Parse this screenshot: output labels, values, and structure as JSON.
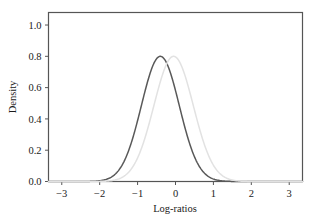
{
  "chart_data": {
    "type": "line",
    "title": "",
    "subtitle": "",
    "xlabel": "Log-ratios",
    "ylabel": "Density",
    "xlim": [
      -3.35,
      3.35
    ],
    "ylim": [
      0.0,
      1.08
    ],
    "grid": false,
    "legend": "none",
    "xticks": [
      "-3",
      "-2",
      "-1",
      "0",
      "1",
      "2",
      "3"
    ],
    "xtick_values": [
      -3,
      -2,
      -1,
      0,
      1,
      2,
      3
    ],
    "yticks": [
      "0.0",
      "0.2",
      "0.4",
      "0.6",
      "0.8",
      "1.0"
    ],
    "ytick_values": [
      0.0,
      0.2,
      0.4,
      0.6,
      0.8,
      1.0
    ],
    "series": [
      {
        "name": "dark-density-curve",
        "color": "#595959",
        "peak_x": -0.4,
        "peak_y": 0.8,
        "mean": -0.4,
        "sd": 0.5,
        "x": [
          -2.4,
          -2.2,
          -2.0,
          -1.9,
          -1.8,
          -1.7,
          -1.6,
          -1.5,
          -1.4,
          -1.3,
          -1.2,
          -1.1,
          -1.0,
          -0.9,
          -0.8,
          -0.7,
          -0.6,
          -0.5,
          -0.4,
          -0.3,
          -0.2,
          -0.1,
          0.0,
          0.1,
          0.2,
          0.3,
          0.4,
          0.5,
          0.6,
          0.7,
          0.8,
          0.9,
          1.0,
          1.1,
          1.2,
          1.3,
          1.4,
          1.6,
          1.8
        ],
        "y": [
          0.0,
          0.001,
          0.003,
          0.005,
          0.009,
          0.015,
          0.025,
          0.039,
          0.06,
          0.088,
          0.124,
          0.169,
          0.222,
          0.282,
          0.346,
          0.411,
          0.475,
          0.533,
          0.58,
          0.614,
          0.631,
          0.631,
          0.614,
          0.58,
          0.533,
          0.475,
          0.411,
          0.346,
          0.282,
          0.222,
          0.169,
          0.124,
          0.088,
          0.06,
          0.039,
          0.025,
          0.015,
          0.005,
          0.001
        ]
      },
      {
        "name": "light-density-curve",
        "color": "#e2e2e2",
        "peak_x": -0.05,
        "peak_y": 0.8,
        "mean": -0.05,
        "sd": 0.52,
        "x": [
          -2.0,
          -1.8,
          -1.6,
          -1.5,
          -1.4,
          -1.3,
          -1.2,
          -1.1,
          -1.0,
          -0.9,
          -0.8,
          -0.7,
          -0.6,
          -0.5,
          -0.4,
          -0.3,
          -0.2,
          -0.1,
          0.0,
          0.1,
          0.2,
          0.3,
          0.4,
          0.5,
          0.6,
          0.7,
          0.8,
          0.9,
          1.0,
          1.2,
          1.4,
          1.6,
          1.8,
          2.0,
          2.2
        ],
        "y": [
          0.001,
          0.003,
          0.009,
          0.015,
          0.025,
          0.039,
          0.06,
          0.088,
          0.124,
          0.169,
          0.222,
          0.282,
          0.346,
          0.411,
          0.475,
          0.533,
          0.58,
          0.614,
          0.631,
          0.614,
          0.58,
          0.533,
          0.475,
          0.411,
          0.346,
          0.282,
          0.222,
          0.169,
          0.124,
          0.06,
          0.025,
          0.009,
          0.003,
          0.001,
          0.0
        ]
      }
    ]
  },
  "axes": {
    "frame_color": "#555555",
    "baseline_color": "#4d4d4d"
  }
}
